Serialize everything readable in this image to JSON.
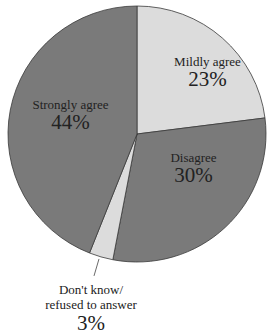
{
  "chart_data": {
    "type": "pie",
    "title": "",
    "start_angle_deg": 0,
    "direction": "clockwise",
    "slices": [
      {
        "label": "Mildly agree",
        "value": 23,
        "display": "23%",
        "color": "#dcdcdc"
      },
      {
        "label": "Disagree",
        "value": 30,
        "display": "30%",
        "color": "#7a7a7a"
      },
      {
        "label": "Don't know/ refused to answer",
        "value": 3,
        "display": "3%",
        "color": "#dcdcdc"
      },
      {
        "label": "Strongly agree",
        "value": 44,
        "display": "44%",
        "color": "#7a7a7a"
      }
    ],
    "legend": "none",
    "labels": "inside (outside with leader line for small slice)"
  },
  "labels": {
    "mild_name": "Mildly agree",
    "mild_pct": "23%",
    "strong_name": "Strongly agree",
    "strong_pct": "44%",
    "dis_name": "Disagree",
    "dis_pct": "30%",
    "dk_name_line1": "Don't know/",
    "dk_name_line2": "refused to answer",
    "dk_pct": "3%"
  },
  "colors": {
    "light": "#dcdcdc",
    "dark": "#7a7a7a",
    "stroke": "#3a3a3a"
  }
}
